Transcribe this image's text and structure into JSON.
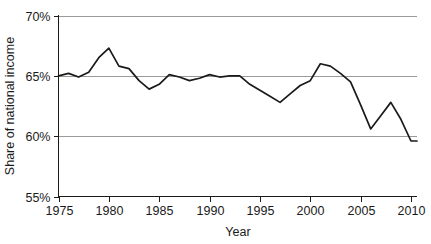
{
  "chart_data": {
    "type": "line",
    "title": "",
    "xlabel": "Year",
    "ylabel": "Share of national income",
    "xlim": [
      1975,
      2010.6
    ],
    "ylim": [
      55,
      70
    ],
    "xticks": [
      1975,
      1980,
      1985,
      1990,
      1995,
      2000,
      2005,
      2010
    ],
    "xtick_labels": [
      "1975",
      "1980",
      "1985",
      "1990",
      "1995",
      "2000",
      "2005",
      "2010"
    ],
    "yticks": [
      55,
      60,
      65,
      70
    ],
    "ytick_labels": [
      "55%",
      "60%",
      "65%",
      "70%"
    ],
    "grid": "horizontal",
    "legend": "none",
    "line_color": "#1a1a1a",
    "grid_color": "#9a9a9a",
    "x": [
      1975,
      1976,
      1977,
      1978,
      1979,
      1980,
      1981,
      1982,
      1983,
      1984,
      1985,
      1986,
      1987,
      1988,
      1989,
      1990,
      1991,
      1992,
      1993,
      1994,
      1995,
      1996,
      1997,
      1998,
      1999,
      2000,
      2001,
      2002,
      2003,
      2004,
      2005,
      2006,
      2007,
      2008,
      2009,
      2010,
      2010.6
    ],
    "values": [
      65.0,
      65.2,
      64.9,
      65.3,
      66.5,
      67.3,
      65.8,
      65.6,
      64.6,
      63.9,
      64.3,
      65.1,
      64.9,
      64.6,
      64.8,
      65.1,
      64.9,
      65.0,
      65.0,
      64.3,
      63.8,
      63.3,
      62.8,
      63.5,
      64.2,
      64.6,
      66.0,
      65.8,
      65.2,
      64.5,
      62.6,
      60.6,
      61.7,
      62.8,
      61.4,
      59.6,
      59.6
    ],
    "series_name": "Share of national income",
    "x_axis_start": 1975,
    "x_axis_end": 2010.6
  },
  "axis": {
    "x_label": "Year",
    "y_label": "Share of national income"
  }
}
